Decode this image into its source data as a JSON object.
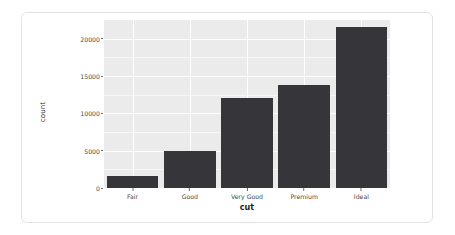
{
  "chart_data": {
    "type": "bar",
    "title": "",
    "subtitle": "",
    "xlabel": "cut",
    "ylabel": "count",
    "categories": [
      "Fair",
      "Good",
      "Very Good",
      "Premium",
      "Ideal"
    ],
    "values": [
      1610,
      4906,
      12082,
      13791,
      21551
    ],
    "ylim": [
      0,
      22500
    ],
    "xlim_categorical": true,
    "y_ticks": [
      0,
      5000,
      10000,
      15000,
      20000
    ],
    "y_tick_labels": [
      "0",
      "5000",
      "10000",
      "15000",
      "20000"
    ],
    "y_minor_ticks": [
      2500,
      7500,
      12500,
      17500
    ],
    "grid": {
      "horizontal_major": true,
      "horizontal_minor": true,
      "vertical_major": true,
      "vertical_minor": false,
      "color_major": "#ffffff",
      "color_minor": "#f7f7f7"
    },
    "legend": {
      "visible": false,
      "position": "none"
    },
    "series": [
      {
        "name": "count",
        "values": [
          1610,
          4906,
          12082,
          13791,
          21551
        ]
      }
    ]
  },
  "style": {
    "bar_color": "#35353a",
    "panel_background": "#ebebeb",
    "card_background": "#ffffff",
    "card_border_color": "#e2e2e2",
    "axis_text_color": "#4a4a4a",
    "axis_title_color": "#1f1f1f",
    "tick_mark_color": "#6e6e6e"
  }
}
